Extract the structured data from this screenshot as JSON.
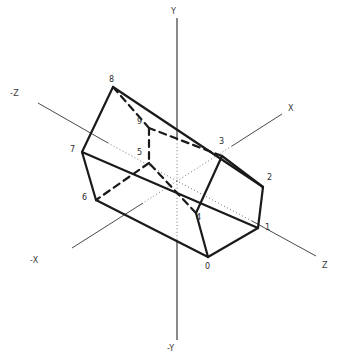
{
  "figure": {
    "type": "3d-wireframe-diagram",
    "background_color": "#ffffff",
    "stroke_color": "#1a1a1a",
    "axis_color": "#4a4a4a",
    "hidden_stroke_color": "#1a1a1a",
    "dotted_axis_color": "#777777"
  },
  "axes": [
    {
      "id": "axis-y-pos",
      "label": "Y",
      "x": 171,
      "y": 7,
      "line": {
        "x1": 177,
        "y1": 18,
        "x2": 177,
        "y2": 340
      },
      "style": "solid"
    },
    {
      "id": "axis-y-neg",
      "label": "-Y",
      "x": 167,
      "y": 344,
      "line": null,
      "style": "solid"
    },
    {
      "id": "axis-x-pos",
      "label": "X",
      "x": 288,
      "y": 104,
      "line": {
        "x1": 282,
        "y1": 114,
        "x2": 177,
        "y2": 181
      },
      "style": "solid"
    },
    {
      "id": "axis-x-neg",
      "label": "-X",
      "x": 30,
      "y": 256,
      "line": {
        "x1": 177,
        "y1": 181,
        "x2": 72,
        "y2": 248
      },
      "style": "solid"
    },
    {
      "id": "axis-z-pos",
      "label": "Z",
      "x": 322,
      "y": 261,
      "line": {
        "x1": 316,
        "y1": 256,
        "x2": 177,
        "y2": 181
      },
      "style": "solid"
    },
    {
      "id": "axis-z-neg",
      "label": "-Z",
      "x": 10,
      "y": 89,
      "line": {
        "x1": 177,
        "y1": 181,
        "x2": 38,
        "y2": 103
      },
      "style": "solid"
    }
  ],
  "vertices": [
    {
      "id": "v0",
      "label": "0",
      "px": 208,
      "py": 257,
      "lx": 205,
      "ly": 262
    },
    {
      "id": "v1",
      "label": "1",
      "px": 258,
      "py": 228,
      "lx": 265,
      "ly": 223
    },
    {
      "id": "v2",
      "label": "2",
      "px": 263,
      "py": 187,
      "lx": 267,
      "ly": 173
    },
    {
      "id": "v3",
      "label": "3",
      "px": 222,
      "py": 156,
      "lx": 219,
      "ly": 137
    },
    {
      "id": "v4",
      "label": "4",
      "px": 196,
      "py": 213,
      "lx": 196,
      "ly": 213
    },
    {
      "id": "v5",
      "label": "5",
      "px": 149,
      "py": 163,
      "lx": 137,
      "ly": 148
    },
    {
      "id": "v6",
      "label": "6",
      "px": 96,
      "py": 200,
      "lx": 82,
      "ly": 193
    },
    {
      "id": "v7",
      "label": "7",
      "px": 82,
      "py": 152,
      "lx": 70,
      "ly": 145
    },
    {
      "id": "v8",
      "label": "8",
      "px": 113,
      "py": 87,
      "lx": 109,
      "ly": 75
    },
    {
      "id": "v9",
      "label": "9",
      "px": 149,
      "py": 128,
      "lx": 137,
      "ly": 117
    }
  ],
  "edges": [
    {
      "from": "v0",
      "to": "v1",
      "hidden": false
    },
    {
      "from": "v1",
      "to": "v2",
      "hidden": false
    },
    {
      "from": "v2",
      "to": "v3",
      "hidden": false
    },
    {
      "from": "v3",
      "to": "v4",
      "hidden": false
    },
    {
      "from": "v4",
      "to": "v0",
      "hidden": false
    },
    {
      "from": "v5",
      "to": "v6",
      "hidden": true
    },
    {
      "from": "v6",
      "to": "v7",
      "hidden": false
    },
    {
      "from": "v7",
      "to": "v8",
      "hidden": false
    },
    {
      "from": "v8",
      "to": "v9",
      "hidden": true
    },
    {
      "from": "v9",
      "to": "v5",
      "hidden": true
    },
    {
      "from": "v0",
      "to": "v6",
      "hidden": false
    },
    {
      "from": "v1",
      "to": "v7",
      "hidden": false
    },
    {
      "from": "v2",
      "to": "v8",
      "hidden": false
    },
    {
      "from": "v3",
      "to": "v9",
      "hidden": true
    },
    {
      "from": "v4",
      "to": "v5",
      "hidden": true
    }
  ]
}
